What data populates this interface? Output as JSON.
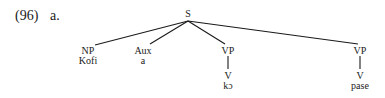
{
  "example": {
    "number": "(96)",
    "sub_label": "a."
  },
  "tree": {
    "root": "S",
    "children": [
      {
        "category": "NP",
        "word": "Kofi"
      },
      {
        "category": "Aux",
        "word": "a"
      },
      {
        "category": "VP",
        "child_category": "V",
        "word": "kɔ"
      },
      {
        "category": "VP",
        "child_category": "V",
        "word": "pase"
      }
    ]
  }
}
